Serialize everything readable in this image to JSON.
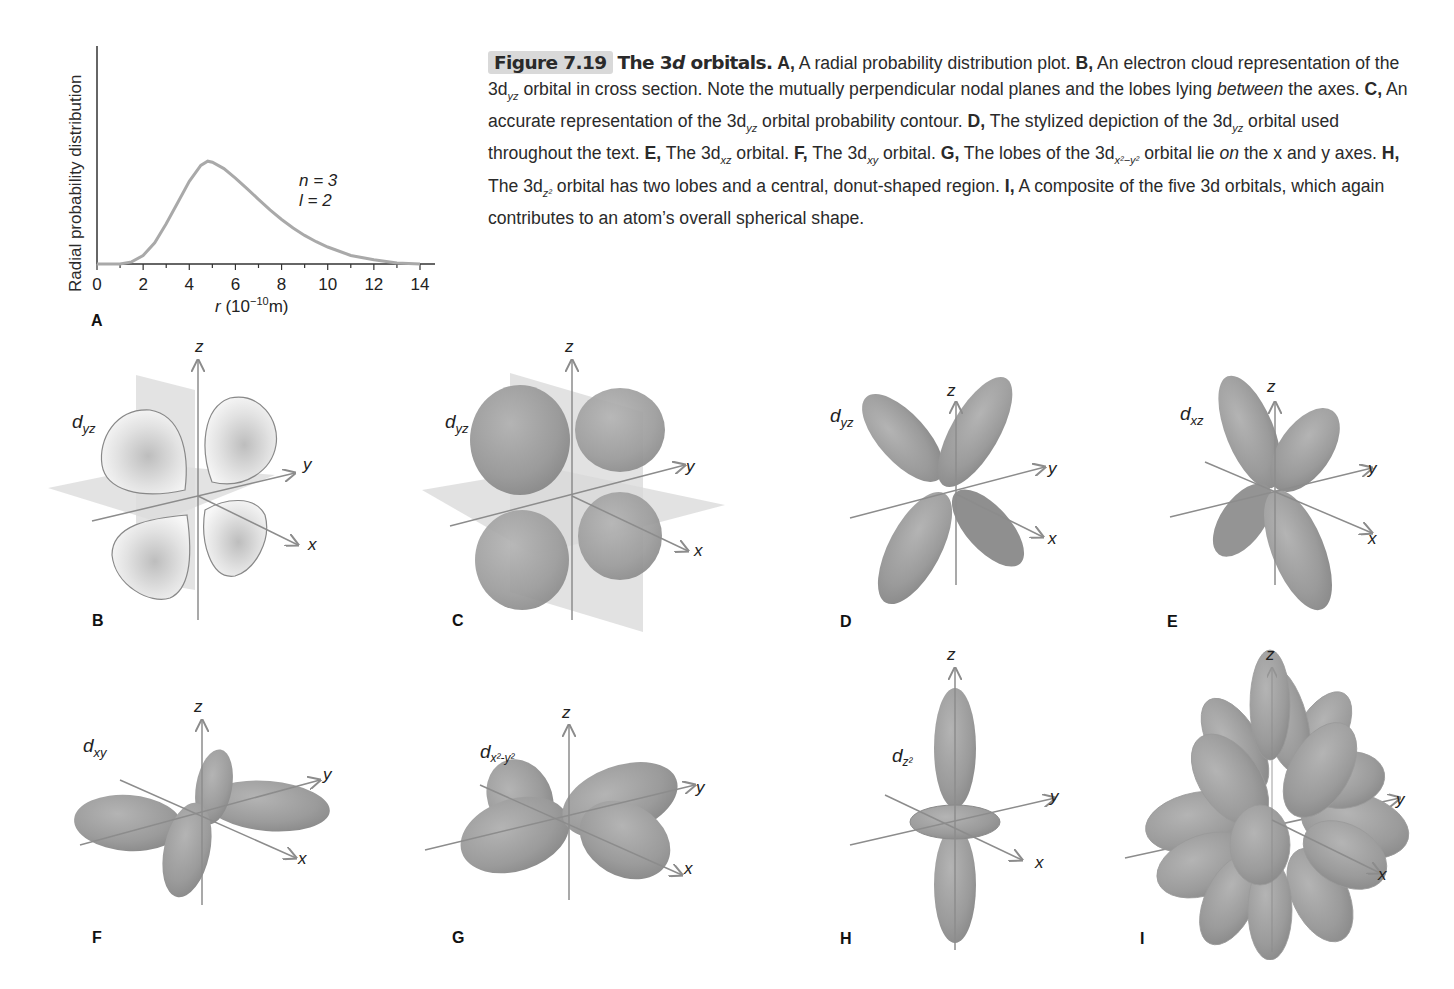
{
  "caption": {
    "figure_number": "Figure 7.19",
    "title_prefix": "The 3",
    "title_d": "d",
    "title_suffix": " orbitals.",
    "parts": [
      {
        "letter": "A,",
        "text": " A radial probability distribution plot. "
      },
      {
        "letter": "B,",
        "text": " An electron cloud representation of the 3d"
      },
      {
        "sub": "yz",
        "text": " orbital in cross section. Note the mutually perpendicular nodal planes and the lobes lying "
      },
      {
        "em": "between",
        "text": " the axes. "
      },
      {
        "letter": "C,",
        "text": " An accurate representation of the 3d"
      },
      {
        "sub": "yz",
        "text": " orbital probability contour. "
      },
      {
        "letter": "D,",
        "text": " The stylized depiction of the 3d"
      },
      {
        "sub": "yz",
        "text": " orbital used throughout the text. "
      },
      {
        "letter": "E,",
        "text": " The 3d"
      },
      {
        "sub": "xz",
        "text": " orbital. "
      },
      {
        "letter": "F,",
        "text": " The 3d"
      },
      {
        "sub": "xy",
        "text": " orbital. "
      },
      {
        "letter": "G,",
        "text": " The lobes of the 3d"
      },
      {
        "sub": "x²−y²",
        "text": " orbital lie "
      },
      {
        "em": "on",
        "text": " the x and y axes. "
      },
      {
        "letter": "H,",
        "text": " The 3d"
      },
      {
        "sub": "z²",
        "text": " orbital has two lobes and a central, donut-shaped region. "
      },
      {
        "letter": "I,",
        "text": " A composite of the five 3d orbitals, which again contributes to an atom’s overall spherical shape."
      }
    ]
  },
  "chart_data": {
    "type": "line",
    "title": "",
    "xlabel": "r (10⁻¹⁰m)",
    "ylabel": "Radial probability distribution",
    "xlim": [
      0,
      14
    ],
    "ylim": [
      0,
      1
    ],
    "xticks": [
      0,
      2,
      4,
      6,
      8,
      10,
      12,
      14
    ],
    "grid": false,
    "annotation": [
      "n = 3",
      "l = 2"
    ],
    "series": [
      {
        "name": "n=3, l=2",
        "x": [
          0,
          1,
          1.5,
          2,
          2.5,
          3,
          3.5,
          4,
          4.5,
          4.8,
          5,
          5.5,
          6,
          6.5,
          7,
          7.5,
          8,
          8.5,
          9,
          9.5,
          10,
          11,
          12,
          13,
          14
        ],
        "values": [
          0,
          0.0,
          0.02,
          0.08,
          0.2,
          0.38,
          0.58,
          0.78,
          0.93,
          0.97,
          0.96,
          0.9,
          0.81,
          0.71,
          0.61,
          0.51,
          0.42,
          0.34,
          0.27,
          0.21,
          0.16,
          0.08,
          0.04,
          0.01,
          0.0
        ]
      }
    ],
    "panel_label": "A"
  },
  "panels": {
    "A": {
      "label": "A"
    },
    "B": {
      "label": "B",
      "orbital": "d",
      "orbital_sub": "yz",
      "axes": [
        "z",
        "y",
        "x"
      ]
    },
    "C": {
      "label": "C",
      "orbital": "d",
      "orbital_sub": "yz",
      "axes": [
        "z",
        "y",
        "x"
      ]
    },
    "D": {
      "label": "D",
      "orbital": "d",
      "orbital_sub": "yz",
      "axes": [
        "z",
        "y",
        "x"
      ]
    },
    "E": {
      "label": "E",
      "orbital": "d",
      "orbital_sub": "xz",
      "axes": [
        "z",
        "y",
        "x"
      ]
    },
    "F": {
      "label": "F",
      "orbital": "d",
      "orbital_sub": "xy",
      "axes": [
        "z",
        "y",
        "x"
      ]
    },
    "G": {
      "label": "G",
      "orbital": "d",
      "orbital_sub": "x2-y2",
      "axes": [
        "z",
        "y",
        "x"
      ]
    },
    "H": {
      "label": "H",
      "orbital": "d",
      "orbital_sub": "z2",
      "axes": [
        "z",
        "y",
        "x"
      ]
    },
    "I": {
      "label": "I",
      "axes": [
        "z",
        "y",
        "x"
      ]
    }
  },
  "colors": {
    "curve": "#a9a9a9",
    "lobe": "#9e9e9e",
    "lobe_dark": "#8a8a8a",
    "plane": "#d8d8d8",
    "axis": "#8c8c8c",
    "badge": "#d9d9d9"
  }
}
